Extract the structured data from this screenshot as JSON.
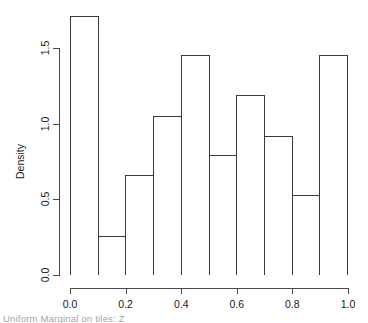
{
  "chart_data": {
    "type": "bar",
    "subtype": "histogram",
    "title": "",
    "xlabel": "",
    "ylabel": "Density",
    "xlim": [
      0.0,
      1.0
    ],
    "ylim": [
      0.0,
      1.71
    ],
    "grid": false,
    "legend": null,
    "binwidth": 0.1,
    "bin_edges": [
      0.0,
      0.1,
      0.2,
      0.3,
      0.4,
      0.5,
      0.6,
      0.7,
      0.8,
      0.9,
      1.0
    ],
    "categories": [
      "0.0-0.1",
      "0.1-0.2",
      "0.2-0.3",
      "0.3-0.4",
      "0.4-0.5",
      "0.5-0.6",
      "0.6-0.7",
      "0.7-0.8",
      "0.8-0.9",
      "0.9-1.0"
    ],
    "values": [
      1.71,
      0.26,
      0.66,
      1.05,
      1.45,
      0.79,
      1.19,
      0.92,
      0.53,
      1.45
    ],
    "xticks": [
      {
        "value": 0.0,
        "label": "0.0"
      },
      {
        "value": 0.2,
        "label": "0.2"
      },
      {
        "value": 0.4,
        "label": "0.4"
      },
      {
        "value": 0.6,
        "label": "0.6"
      },
      {
        "value": 0.8,
        "label": "0.8"
      },
      {
        "value": 1.0,
        "label": "1.0"
      }
    ],
    "yticks": [
      {
        "value": 0.0,
        "label": "0.0"
      },
      {
        "value": 0.5,
        "label": "0.5"
      },
      {
        "value": 1.0,
        "label": "1.0"
      },
      {
        "value": 1.5,
        "label": "1.5"
      }
    ],
    "colors": {
      "bar_stroke": "#3a3a3a",
      "bar_fill": "transparent",
      "axis": "#4a4a4a",
      "text": "#1a1a1a",
      "background": "#ffffff"
    }
  },
  "caption": {
    "text": "Uniform Marginal on tiles: Z"
  }
}
